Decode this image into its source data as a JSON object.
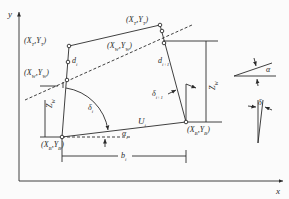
{
  "axes": {
    "x_label": "x",
    "y_label": "y"
  },
  "points": {
    "T_i": {
      "label": "(X",
      "sub1": "T",
      "sub1b": "i",
      "mid": ",Y",
      "sub2": "T",
      "sub2b": "i",
      "end": ")"
    },
    "W_i": {
      "label": "(X",
      "sub1": "W",
      "sub1b": "i",
      "mid": ",Y",
      "sub2": "W",
      "sub2b": "i",
      "end": ")"
    },
    "B_i": {
      "label": "(X",
      "sub1": "B",
      "sub1b": "i",
      "mid": ",Y",
      "sub2": "B",
      "sub2b": "i",
      "end": ")"
    },
    "T_i1": {
      "label": "(X",
      "sub1": "T",
      "sub1b": "i+1",
      "mid": ",Y",
      "sub2": "T",
      "sub2b": "i+1",
      "end": ")"
    },
    "W_i1": {
      "label": "(X",
      "sub1": "W",
      "sub1b": "i+1",
      "mid": ",Y",
      "sub2": "W",
      "sub2b": "i+1",
      "end": ")"
    },
    "B_i1": {
      "label": "(X",
      "sub1": "B",
      "sub1b": "i+1",
      "mid": ",Y",
      "sub2": "B",
      "sub2b": "i+1",
      "end": ")"
    }
  },
  "labels": {
    "d_i": {
      "main": "d",
      "sub": "i"
    },
    "d_i1": {
      "main": "d",
      "sub": "i+1"
    },
    "delta_i": {
      "main": "δ",
      "sub": "i"
    },
    "delta_i1": {
      "main": "δ",
      "sub": "i+1"
    },
    "alpha_i": {
      "main": "α",
      "sub": "i"
    },
    "U_i": {
      "main": "U",
      "sub": "i"
    },
    "b_i": {
      "main": "b",
      "sub": "i"
    },
    "Z_Wi": {
      "main": "Z",
      "sub": "W",
      "subb": "i"
    },
    "Z_Wi1": {
      "main": "Z",
      "sub": "W",
      "subb": "i+1"
    },
    "alpha_legend": "α",
    "delta_legend": "δ"
  },
  "colors": {
    "line": "#2a2a2a",
    "background": "#fbfbfb"
  }
}
